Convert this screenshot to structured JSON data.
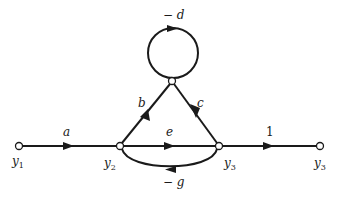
{
  "figure": {
    "type": "signal-flow-graph",
    "colors": {
      "stroke": "#1a1a1a",
      "background": "#ffffff"
    }
  },
  "nodes": [
    {
      "id": "y1",
      "var": "y",
      "sub": "1",
      "x": 19,
      "y": 146
    },
    {
      "id": "y2",
      "var": "y",
      "sub": "2",
      "x": 120,
      "y": 146
    },
    {
      "id": "n_top",
      "x": 172,
      "y": 81
    },
    {
      "id": "y3",
      "var": "y",
      "sub": "3",
      "x": 219,
      "y": 146
    },
    {
      "id": "y3_out",
      "var": "y",
      "sub": "3",
      "x": 320,
      "y": 146
    }
  ],
  "node_labels": {
    "y1": {
      "var": "y",
      "sub": "1"
    },
    "y2": {
      "var": "y",
      "sub": "2"
    },
    "y3": {
      "var": "y",
      "sub": "3"
    },
    "y3_out": {
      "var": "y",
      "sub": "3"
    }
  },
  "edges": [
    {
      "from": "y1",
      "to": "y2",
      "gain": "a"
    },
    {
      "from": "y2",
      "to": "n_top",
      "gain": "b"
    },
    {
      "from": "n_top",
      "to": "n_top",
      "gain": "− d",
      "self_loop": true
    },
    {
      "from": "n_top",
      "to": "y3",
      "gain": "c"
    },
    {
      "from": "y2",
      "to": "y3",
      "gain": "e"
    },
    {
      "from": "y3",
      "to": "y2",
      "gain": "− g"
    },
    {
      "from": "y3",
      "to": "y3_out",
      "gain": "1"
    }
  ],
  "gains": {
    "a": "a",
    "b": "b",
    "c": "c",
    "d": "− d",
    "e": "e",
    "g": "− g",
    "one": "1"
  }
}
